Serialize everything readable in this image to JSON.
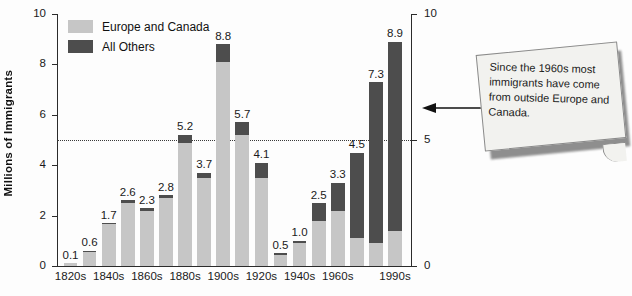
{
  "chart_data": {
    "type": "bar",
    "title": "",
    "xlabel": "",
    "ylabel": "Millions of Immigrants",
    "ylim": [
      0,
      10
    ],
    "yticks_left": [
      "0",
      "2",
      "4",
      "6",
      "8",
      "10"
    ],
    "yticks_left_values": [
      0,
      2,
      4,
      6,
      8,
      10
    ],
    "yticks_right": [
      "0",
      "5",
      "10"
    ],
    "yticks_right_values": [
      0,
      5,
      10
    ],
    "grid": false,
    "reference_line": 5,
    "legend_position": "top-left",
    "categories": [
      "1820s",
      "1830s",
      "1840s",
      "1850s",
      "1860s",
      "1870s",
      "1880s",
      "1890s",
      "1900s",
      "1910s",
      "1920s",
      "1930s",
      "1940s",
      "1950s",
      "1960s",
      "1970s",
      "1980s",
      "1990s"
    ],
    "tick_labels": [
      "1820s",
      "1840s",
      "1860s",
      "1880s",
      "1900s",
      "1920s",
      "1940s",
      "1960s",
      "1990s"
    ],
    "series": [
      {
        "name": "Europe and Canada",
        "color": "#c6c6c6",
        "values": [
          0.1,
          0.58,
          1.65,
          2.5,
          2.2,
          2.7,
          4.9,
          3.5,
          8.1,
          5.2,
          3.5,
          0.45,
          0.9,
          1.8,
          2.2,
          1.1,
          0.9,
          1.4
        ]
      },
      {
        "name": "All Others",
        "color": "#4d4d4d",
        "values": [
          0.0,
          0.02,
          0.05,
          0.1,
          0.1,
          0.1,
          0.3,
          0.2,
          0.7,
          0.5,
          0.6,
          0.05,
          0.1,
          0.7,
          1.1,
          3.4,
          6.4,
          7.5
        ]
      }
    ],
    "totals": [
      0.1,
      0.6,
      1.7,
      2.6,
      2.3,
      2.8,
      5.2,
      3.7,
      8.8,
      5.7,
      4.1,
      0.5,
      1.0,
      2.5,
      3.3,
      4.5,
      7.3,
      8.9
    ],
    "total_labels": [
      "0.1",
      "0.6",
      "1.7",
      "2.6",
      "2.3",
      "2.8",
      "5.2",
      "3.7",
      "8.8",
      "5.7",
      "4.1",
      "0.5",
      "1.0",
      "2.5",
      "3.3",
      "4.5",
      "7.3",
      "8.9"
    ]
  },
  "legend": {
    "items": [
      {
        "label": "Europe and Canada",
        "color": "#c6c6c6"
      },
      {
        "label": "All Others",
        "color": "#4d4d4d"
      }
    ]
  },
  "callout": {
    "text": "Since the 1960s most immigrants have come from outside Europe and Canada."
  },
  "bottom_caption": {
    "text": ""
  }
}
